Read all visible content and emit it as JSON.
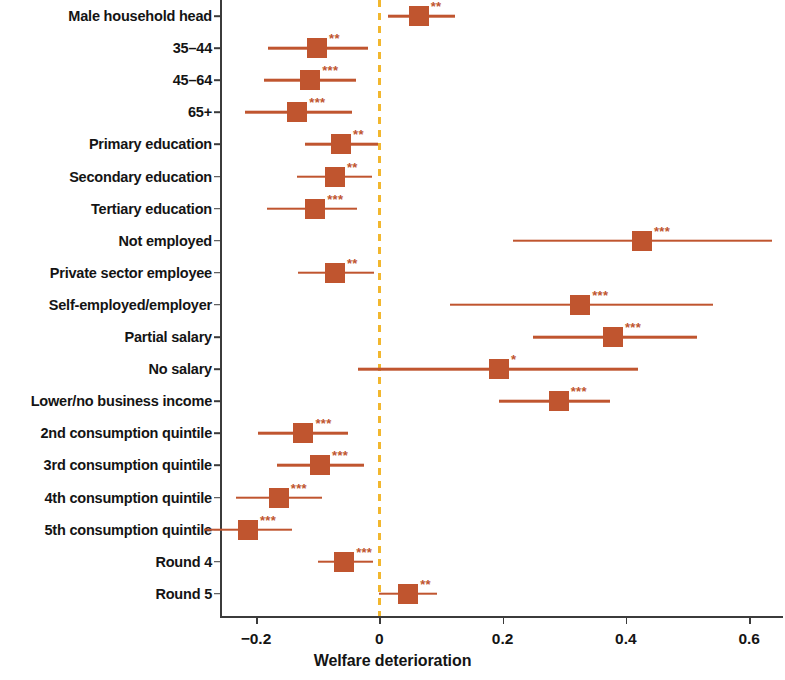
{
  "chart_data": {
    "type": "bar",
    "plot_style": "forest-plot",
    "title": "",
    "xlabel": "Welfare deterioration",
    "ylabel": "",
    "xlim": [
      -0.29,
      0.66
    ],
    "xticks": [
      -0.2,
      0,
      0.2,
      0.4,
      0.6
    ],
    "xticklabels": [
      "−0.2",
      "0",
      "0.2",
      "0.4",
      "0.6"
    ],
    "grid": false,
    "legend": "none",
    "reference_line": {
      "value": 0,
      "style": "dashed",
      "color": "#f2b72e"
    },
    "marker_color": "#c0552f",
    "significance_legend": {
      "*": "p < 0.10",
      "**": "p < 0.05",
      "***": "p < 0.01"
    },
    "categories": [
      "Male household head",
      "35–44",
      "45–64",
      "65+",
      "Primary education",
      "Secondary education",
      "Tertiary education",
      "Not employed",
      "Private sector employee",
      "Self-employed/employer",
      "Partial salary",
      "No salary",
      "Lower/no business income",
      "2nd consumption quintile",
      "3rd consumption quintile",
      "4th consumption quintile",
      "5th consumption quintile",
      "Round 4",
      "Round 5"
    ],
    "points": [
      {
        "label": "Male household head",
        "estimate": 0.064,
        "ci_low": 0.014,
        "ci_high": 0.123,
        "stars": "**"
      },
      {
        "label": "35–44",
        "estimate": -0.101,
        "ci_low": -0.18,
        "ci_high": -0.018,
        "stars": "**"
      },
      {
        "label": "45–64",
        "estimate": -0.112,
        "ci_low": -0.187,
        "ci_high": -0.038,
        "stars": "***"
      },
      {
        "label": "65+",
        "estimate": -0.133,
        "ci_low": -0.218,
        "ci_high": -0.044,
        "stars": "***"
      },
      {
        "label": "Primary education",
        "estimate": -0.062,
        "ci_low": -0.12,
        "ci_high": -0.002,
        "stars": "**"
      },
      {
        "label": "Secondary education",
        "estimate": -0.072,
        "ci_low": -0.133,
        "ci_high": -0.012,
        "stars": "**"
      },
      {
        "label": "Tertiary education",
        "estimate": -0.104,
        "ci_low": -0.182,
        "ci_high": -0.036,
        "stars": "***"
      },
      {
        "label": "Not employed",
        "estimate": 0.426,
        "ci_low": 0.217,
        "ci_high": 0.637,
        "stars": "***"
      },
      {
        "label": "Private sector employee",
        "estimate": -0.072,
        "ci_low": -0.132,
        "ci_high": -0.009,
        "stars": "**"
      },
      {
        "label": "Self-employed/employer",
        "estimate": 0.326,
        "ci_low": 0.115,
        "ci_high": 0.541,
        "stars": "***"
      },
      {
        "label": "Partial salary",
        "estimate": 0.379,
        "ci_low": 0.25,
        "ci_high": 0.516,
        "stars": "***"
      },
      {
        "label": "No salary",
        "estimate": 0.194,
        "ci_low": -0.035,
        "ci_high": 0.42,
        "stars": "*"
      },
      {
        "label": "Lower/no business income",
        "estimate": 0.291,
        "ci_low": 0.194,
        "ci_high": 0.374,
        "stars": "***"
      },
      {
        "label": "2nd consumption quintile",
        "estimate": -0.123,
        "ci_low": -0.196,
        "ci_high": -0.05,
        "stars": "***"
      },
      {
        "label": "3rd consumption quintile",
        "estimate": -0.096,
        "ci_low": -0.166,
        "ci_high": -0.024,
        "stars": "***"
      },
      {
        "label": "4th consumption quintile",
        "estimate": -0.163,
        "ci_low": -0.232,
        "ci_high": -0.093,
        "stars": "***"
      },
      {
        "label": "5th consumption quintile",
        "estimate": -0.213,
        "ci_low": -0.284,
        "ci_high": -0.142,
        "stars": "***"
      },
      {
        "label": "Round 4",
        "estimate": -0.057,
        "ci_low": -0.1,
        "ci_high": -0.01,
        "stars": "***"
      },
      {
        "label": "Round 5",
        "estimate": 0.047,
        "ci_low": 0.0,
        "ci_high": 0.093,
        "stars": "**"
      }
    ]
  },
  "axis": {
    "x_title": "Welfare deterioration",
    "x_tick_labels": [
      "−0.2",
      "0",
      "0.2",
      "0.4",
      "0.6"
    ]
  }
}
